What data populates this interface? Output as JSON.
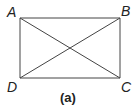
{
  "diagram": {
    "caption": "(a)",
    "stroke_color": "#444444",
    "vertices": {
      "A": {
        "label": "A",
        "x": 20,
        "y": 18
      },
      "B": {
        "label": "B",
        "x": 120,
        "y": 18
      },
      "C": {
        "label": "C",
        "x": 120,
        "y": 78
      },
      "D": {
        "label": "D",
        "x": 20,
        "y": 78
      }
    },
    "edges": [
      "AB",
      "BC",
      "CD",
      "DA",
      "AC",
      "BD"
    ]
  }
}
